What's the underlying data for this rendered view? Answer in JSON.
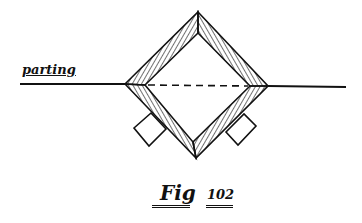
{
  "diagram": {
    "label_parting": "parting",
    "caption_prefix": "Fig",
    "caption_number": "102",
    "colors": {
      "ink": "#111111",
      "background": "#ffffff"
    },
    "elements": [
      "parting-line",
      "diamond-frame-outer",
      "diamond-frame-inner",
      "hatched-walls",
      "dashed-parting-through-box",
      "left-square-block",
      "right-square-block"
    ]
  }
}
